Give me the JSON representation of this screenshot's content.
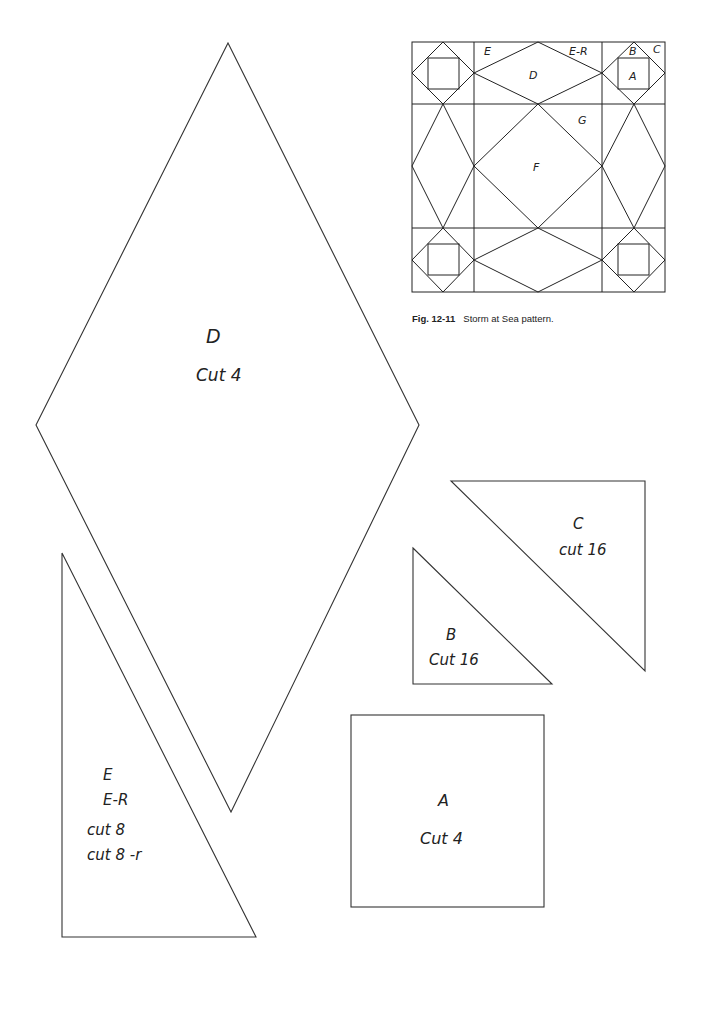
{
  "figure": {
    "number": "Fig. 12-11",
    "caption": "Storm at Sea pattern.",
    "block_labels": {
      "E": "E",
      "E_R": "E-R",
      "D": "D",
      "B": "B",
      "C": "C",
      "A": "A",
      "G": "G",
      "F": "F"
    }
  },
  "templates": {
    "D": {
      "letter": "D",
      "instruction": "Cut 4"
    },
    "E": {
      "letter": "E",
      "letter_reverse": "E-R",
      "instruction": "cut 8",
      "instruction_reverse": "cut 8 -r"
    },
    "C": {
      "letter": "C",
      "instruction": "cut 16"
    },
    "B": {
      "letter": "B",
      "instruction": "Cut 16"
    },
    "A": {
      "letter": "A",
      "instruction": "Cut 4"
    }
  },
  "colors": {
    "line": "#333333",
    "text": "#222222",
    "background": "#ffffff"
  }
}
